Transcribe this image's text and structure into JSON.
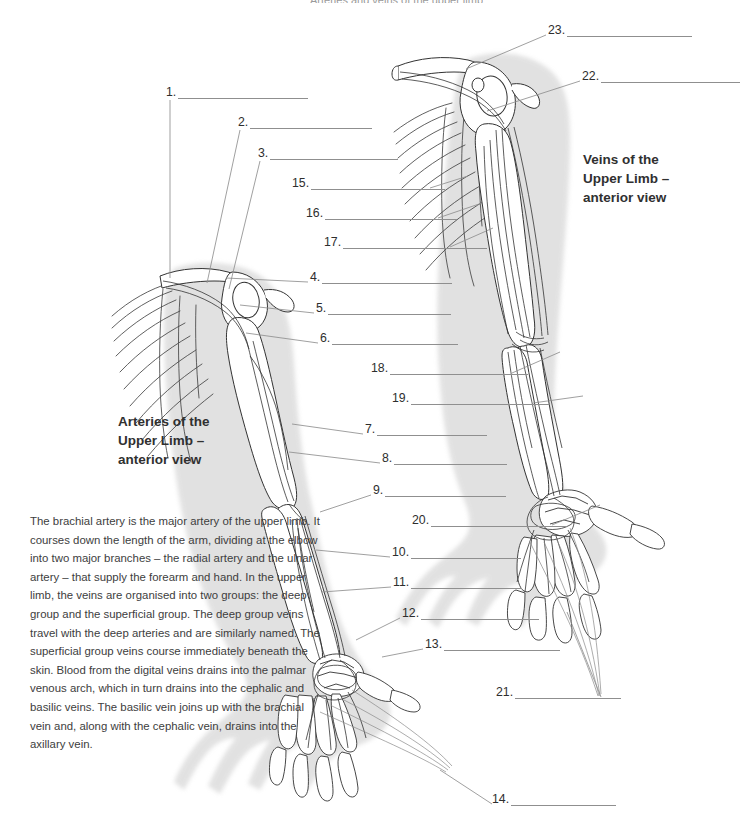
{
  "page": {
    "top_cropped_title": "Arteries and veins of the upper limb",
    "background": "#ffffff",
    "shadow_color": "#c9c9c9",
    "ink_color": "#3a3a3a",
    "rule_color": "#8f8f8f"
  },
  "headings": {
    "arteries": "Arteries of the\nUpper Limb –\nanterior view",
    "veins": "Veins of the\nUpper Limb –\nanterior view"
  },
  "paragraph": {
    "text": "The brachial artery is the major artery of the upper limb. It courses down the length of the arm, dividing at the elbow into two major branches – the radial artery and the ulnar artery – that supply the forearm and hand. In the upper limb, the veins are organised into two groups: the deep group and the superficial group. The deep group veins travel with the deep arteries and are similarly named. The superficial group veins course immediately beneath the skin. Blood from the digital veins drains into the palmar venous arch, which in turn drains into the cephalic and basilic veins. The basilic vein joins up with the brachial vein and, along with the cephalic vein, drains into the axillary vein."
  },
  "callouts": [
    {
      "id": 1,
      "label": "1.",
      "answer": "",
      "x": 166,
      "y": 86,
      "rule_width": 130,
      "leader": [
        [
          170,
          100
        ],
        [
          170,
          278
        ]
      ]
    },
    {
      "id": 2,
      "label": "2.",
      "answer": "",
      "x": 238,
      "y": 116,
      "rule_width": 122,
      "leader": [
        [
          240,
          130
        ],
        [
          207,
          283
        ]
      ]
    },
    {
      "id": 3,
      "label": "3.",
      "answer": "",
      "x": 258,
      "y": 147,
      "rule_width": 128,
      "leader": [
        [
          260,
          161
        ],
        [
          229,
          289
        ]
      ]
    },
    {
      "id": 15,
      "label": "15.",
      "answer": "",
      "x": 292,
      "y": 177,
      "rule_width": 134,
      "leader": [
        [
          430,
          188
        ],
        [
          468,
          176
        ]
      ]
    },
    {
      "id": 16,
      "label": "16.",
      "answer": "",
      "x": 306,
      "y": 207,
      "rule_width": 132,
      "leader": [
        [
          438,
          218
        ],
        [
          482,
          203
        ]
      ]
    },
    {
      "id": 17,
      "label": "17.",
      "answer": "",
      "x": 324,
      "y": 236,
      "rule_width": 144,
      "leader": [
        [
          450,
          247
        ],
        [
          493,
          228
        ]
      ]
    },
    {
      "id": 4,
      "label": "4.",
      "answer": "",
      "x": 310,
      "y": 271,
      "rule_width": 130,
      "leader": [
        [
          308,
          282
        ],
        [
          226,
          278
        ]
      ]
    },
    {
      "id": 5,
      "label": "5.",
      "answer": "",
      "x": 316,
      "y": 302,
      "rule_width": 123,
      "leader": [
        [
          314,
          313
        ],
        [
          240,
          305
        ]
      ]
    },
    {
      "id": 6,
      "label": "6.",
      "answer": "",
      "x": 320,
      "y": 332,
      "rule_width": 126,
      "leader": [
        [
          318,
          343
        ],
        [
          246,
          333
        ]
      ]
    },
    {
      "id": 18,
      "label": "18.",
      "answer": "",
      "x": 371,
      "y": 362,
      "rule_width": 138,
      "leader": [
        [
          512,
          373
        ],
        [
          560,
          352
        ]
      ]
    },
    {
      "id": 19,
      "label": "19.",
      "answer": "",
      "x": 392,
      "y": 392,
      "rule_width": 138,
      "leader": [
        [
          533,
          403
        ],
        [
          583,
          396
        ]
      ]
    },
    {
      "id": 7,
      "label": "7.",
      "answer": "",
      "x": 365,
      "y": 423,
      "rule_width": 110,
      "leader": [
        [
          363,
          434
        ],
        [
          292,
          424
        ]
      ]
    },
    {
      "id": 8,
      "label": "8.",
      "answer": "",
      "x": 382,
      "y": 452,
      "rule_width": 113,
      "leader": [
        [
          380,
          463
        ],
        [
          289,
          452
        ]
      ]
    },
    {
      "id": 9,
      "label": "9.",
      "answer": "",
      "x": 373,
      "y": 484,
      "rule_width": 121,
      "leader": [
        [
          371,
          495
        ],
        [
          320,
          512
        ]
      ]
    },
    {
      "id": 20,
      "label": "20.",
      "answer": "",
      "x": 412,
      "y": 514,
      "rule_width": 136,
      "leader": [
        [
          552,
          525
        ],
        [
          600,
          505
        ]
      ]
    },
    {
      "id": 10,
      "label": "10.",
      "answer": "",
      "x": 392,
      "y": 546,
      "rule_width": 110,
      "leader": [
        [
          390,
          557
        ],
        [
          316,
          550
        ]
      ]
    },
    {
      "id": 11,
      "label": "11.",
      "answer": "",
      "x": 393,
      "y": 576,
      "rule_width": 111,
      "leader": [
        [
          391,
          587
        ],
        [
          322,
          592
        ]
      ]
    },
    {
      "id": 12,
      "label": "12.",
      "answer": "",
      "x": 402,
      "y": 607,
      "rule_width": 118,
      "leader": [
        [
          400,
          618
        ],
        [
          356,
          640
        ]
      ]
    },
    {
      "id": 13,
      "label": "13.",
      "answer": "",
      "x": 425,
      "y": 638,
      "rule_width": 116,
      "leader": [
        [
          423,
          649
        ],
        [
          382,
          657
        ]
      ]
    },
    {
      "id": 21,
      "label": "21.",
      "answer": "",
      "x": 496,
      "y": 686,
      "rule_width": 106,
      "leader": [
        [
          601,
          697
        ],
        [
          567,
          612
        ]
      ]
    },
    {
      "id": 14,
      "label": "14.",
      "answer": "",
      "x": 492,
      "y": 793,
      "rule_width": 105,
      "leader": [
        [
          492,
          804
        ],
        [
          440,
          770
        ]
      ]
    },
    {
      "id": 22,
      "label": "22.",
      "answer": "",
      "x": 582,
      "y": 70,
      "rule_width": 139,
      "leader": [
        [
          580,
          81
        ],
        [
          487,
          111
        ]
      ]
    },
    {
      "id": 23,
      "label": "23.",
      "answer": "",
      "x": 548,
      "y": 24,
      "rule_width": 125,
      "leader": [
        [
          546,
          35
        ],
        [
          466,
          69
        ]
      ]
    }
  ],
  "illustrations": [
    {
      "name": "arteries-upper-limb-anterior",
      "side": "left",
      "description": "Left upper limb line drawing, anterior view, showing ribs, clavicle, scapula, humerus, radius, ulna, carpals, metacarpals and phalanges with arterial tree"
    },
    {
      "name": "veins-upper-limb-anterior",
      "side": "right",
      "description": "Right upper limb line drawing, anterior view, showing ribs, clavicle, scapula, humerus, radius, ulna and hand skeleton with venous network"
    }
  ]
}
